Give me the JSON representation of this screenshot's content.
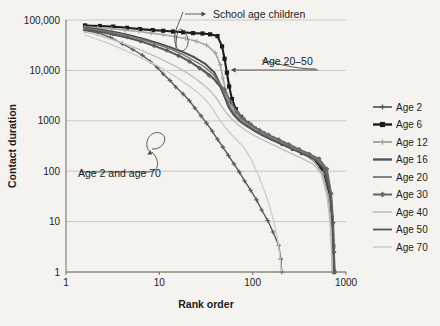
{
  "chart_data": {
    "type": "line",
    "title": "",
    "xlabel": "Rank order",
    "ylabel": "Contact duration",
    "xscale": "log",
    "yscale": "log",
    "xlim": [
      1,
      1000
    ],
    "ylim": [
      1,
      100000
    ],
    "grid": true,
    "xticks": [
      1,
      10,
      100,
      1000
    ],
    "xticklabels": [
      "1",
      "10",
      "100",
      "1000"
    ],
    "yticks": [
      1,
      10,
      100,
      1000,
      10000,
      100000
    ],
    "yticklabels": [
      "1",
      "10",
      "100",
      "1000",
      "10,000",
      "100,000"
    ],
    "legend_position": "right",
    "annotations": [
      {
        "text": "School age children",
        "x": 60,
        "y": 90000
      },
      {
        "text": "Age 20–50",
        "x": 150,
        "y": 17000
      },
      {
        "text": "Age 2 and age 70",
        "x": 6,
        "y": 330
      }
    ],
    "series": [
      {
        "name": "Age 2",
        "color": "#595959",
        "marker": "plus",
        "width": 1.4,
        "x": [
          1.6,
          2.2,
          3.0,
          4.0,
          5.2,
          6.6,
          8.0,
          9.5,
          11,
          13,
          15,
          18,
          21,
          24,
          28,
          32,
          37,
          42,
          48,
          55,
          63,
          72,
          82,
          95,
          110,
          125,
          145,
          165,
          190,
          200,
          205
        ],
        "y": [
          62000,
          56000,
          45000,
          34000,
          26000,
          20000,
          15000,
          11500,
          8500,
          6300,
          4700,
          3400,
          2500,
          1800,
          1250,
          900,
          620,
          430,
          300,
          205,
          140,
          96,
          64,
          42,
          27,
          17,
          10.5,
          6.2,
          3.4,
          1.8,
          1.0
        ]
      },
      {
        "name": "Age 6",
        "color": "#1c1c1c",
        "marker": "square",
        "width": 2.1,
        "x": [
          1.6,
          2.3,
          3.2,
          4.5,
          6.2,
          8.5,
          11,
          14,
          18,
          23,
          29,
          35,
          42,
          47,
          50,
          53,
          56,
          60,
          66,
          75,
          88,
          105,
          130,
          165,
          210,
          270,
          340,
          430,
          540,
          640,
          700,
          730,
          745
        ],
        "y": [
          78000,
          76000,
          74000,
          70000,
          66000,
          63000,
          61000,
          59000,
          57000,
          55000,
          54000,
          52000,
          48000,
          30000,
          17000,
          9000,
          4800,
          2700,
          1700,
          1200,
          900,
          700,
          560,
          440,
          350,
          280,
          230,
          190,
          120,
          45,
          12,
          3.2,
          1.0
        ]
      },
      {
        "name": "Age 12",
        "color": "#a6a6a6",
        "marker": "plus",
        "width": 1.6,
        "x": [
          1.6,
          2.2,
          3.1,
          4.3,
          6.0,
          8.2,
          11,
          14.5,
          19,
          25,
          32,
          40,
          45,
          48,
          52,
          58,
          66,
          78,
          95,
          120,
          155,
          200,
          260,
          340,
          440,
          560,
          660,
          700,
          715
        ],
        "y": [
          72000,
          70000,
          67000,
          63000,
          59000,
          55000,
          51000,
          47000,
          43000,
          38000,
          32000,
          22000,
          13000,
          7000,
          3600,
          2100,
          1400,
          1000,
          780,
          600,
          470,
          370,
          290,
          230,
          170,
          90,
          28,
          5.5,
          1.0
        ]
      },
      {
        "name": "Age 16",
        "color": "#4f4f4f",
        "marker": "none",
        "width": 2.0,
        "x": [
          1.6,
          2.4,
          3.4,
          4.8,
          6.8,
          9.5,
          13,
          18,
          24,
          31,
          39,
          45,
          50,
          55,
          62,
          72,
          86,
          105,
          130,
          165,
          215,
          280,
          360,
          460,
          580,
          670,
          720,
          740,
          752
        ],
        "y": [
          70000,
          64000,
          57000,
          50000,
          42000,
          35000,
          29000,
          23000,
          18000,
          13500,
          9000,
          5200,
          3000,
          1900,
          1350,
          1000,
          790,
          630,
          510,
          410,
          330,
          265,
          215,
          175,
          115,
          40,
          10,
          2.6,
          1.0
        ]
      },
      {
        "name": "Age 20",
        "color": "#7d7d7d",
        "marker": "none",
        "width": 1.6,
        "x": [
          1.6,
          2.3,
          3.3,
          4.7,
          6.7,
          9.4,
          13,
          17.5,
          23,
          30,
          38,
          46,
          52,
          58,
          66,
          78,
          94,
          115,
          145,
          185,
          240,
          310,
          400,
          510,
          620,
          690,
          725,
          740,
          750
        ],
        "y": [
          68000,
          62000,
          55000,
          48000,
          40000,
          33000,
          27000,
          21000,
          16000,
          12000,
          8200,
          5000,
          2900,
          1800,
          1280,
          960,
          760,
          610,
          495,
          400,
          322,
          258,
          208,
          168,
          105,
          35,
          9,
          2.4,
          1.0
        ]
      },
      {
        "name": "Age 30",
        "color": "#6b6b6b",
        "marker": "diamond",
        "width": 1.8,
        "x": [
          1.6,
          2.3,
          3.2,
          4.5,
          6.3,
          8.8,
          12,
          16,
          21,
          27,
          34,
          42,
          50,
          58,
          68,
          80,
          96,
          118,
          148,
          190,
          245,
          315,
          405,
          515,
          625,
          695,
          730,
          745,
          755
        ],
        "y": [
          66000,
          60000,
          53000,
          46000,
          38000,
          31000,
          25000,
          19500,
          15000,
          11000,
          8000,
          5800,
          4200,
          2400,
          1500,
          1100,
          840,
          660,
          530,
          425,
          340,
          272,
          220,
          176,
          110,
          36,
          9.5,
          2.5,
          1.0
        ]
      },
      {
        "name": "Age 40",
        "color": "#c0c0c0",
        "marker": "none",
        "width": 1.4,
        "x": [
          1.6,
          2.2,
          3.0,
          4.2,
          5.8,
          8.0,
          11,
          15,
          20,
          26,
          33,
          40,
          46,
          52,
          60,
          70,
          84,
          102,
          128,
          162,
          208,
          268,
          345,
          440,
          545,
          630,
          680,
          700,
          712
        ],
        "y": [
          58000,
          50000,
          42000,
          34000,
          27000,
          21000,
          16000,
          12000,
          8800,
          6300,
          4400,
          3000,
          2000,
          1450,
          1080,
          830,
          650,
          520,
          420,
          340,
          272,
          218,
          175,
          140,
          88,
          30,
          8,
          2.2,
          1.0
        ]
      },
      {
        "name": "Age 50",
        "color": "#555555",
        "marker": "none",
        "width": 1.5,
        "x": [
          1.6,
          2.3,
          3.2,
          4.6,
          6.5,
          9.0,
          12.5,
          17,
          22,
          29,
          37,
          45,
          51,
          57,
          65,
          76,
          92,
          112,
          140,
          180,
          232,
          300,
          385,
          490,
          600,
          680,
          718,
          735,
          748
        ],
        "y": [
          64000,
          58000,
          51000,
          44000,
          37000,
          30000,
          24000,
          19000,
          14500,
          10500,
          7400,
          4600,
          2750,
          1700,
          1220,
          920,
          730,
          585,
          472,
          382,
          308,
          247,
          200,
          160,
          100,
          33,
          8.8,
          2.3,
          1.0
        ]
      },
      {
        "name": "Age 70",
        "color": "#cccccc",
        "marker": "none",
        "width": 1.3,
        "x": [
          1.6,
          2.1,
          2.9,
          3.9,
          5.3,
          7.2,
          9.8,
          13,
          17,
          22,
          28,
          34,
          39,
          44,
          50,
          58,
          68,
          80,
          96,
          116,
          140,
          165,
          185,
          195,
          200,
          203
        ],
        "y": [
          50000,
          42000,
          34000,
          27000,
          21000,
          16000,
          12000,
          8800,
          6400,
          4600,
          3200,
          2200,
          1500,
          1050,
          760,
          560,
          410,
          300,
          175,
          80,
          32,
          12,
          4.5,
          2.2,
          1.4,
          1.0
        ]
      }
    ]
  },
  "legend": {
    "items": [
      {
        "label": "Age 2"
      },
      {
        "label": "Age 6"
      },
      {
        "label": "Age 12"
      },
      {
        "label": "Age 16"
      },
      {
        "label": "Age 20"
      },
      {
        "label": "Age 30"
      },
      {
        "label": "Age 40"
      },
      {
        "label": "Age 50"
      },
      {
        "label": "Age 70"
      }
    ]
  }
}
